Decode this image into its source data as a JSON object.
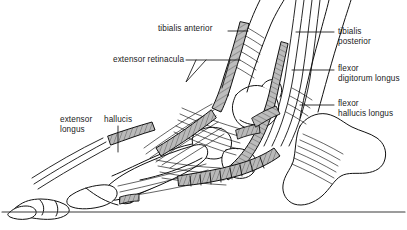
{
  "figure": {
    "ground_line": "ground-reference-line",
    "colors": {
      "outline": "#111111",
      "tendon_fill": "#a8a8a8",
      "tendon_fill_light": "#c9c9c9",
      "background": "#ffffff",
      "label_text": "#1a1a1a",
      "leader_line": "#111111"
    }
  },
  "labels": {
    "tibialis_anterior": {
      "text": "tibialis anterior"
    },
    "extensor_retinacula": {
      "text": "extensor retinacula"
    },
    "tibialis_posterior": {
      "line1": "tibialis",
      "line2": "posterior"
    },
    "flexor_digitorum_longus": {
      "line1": "flexor",
      "line2": "digitorum longus"
    },
    "flexor_hallucis_longus": {
      "line1": "flexor",
      "line2": "hallucis longus"
    },
    "extensor_hallucis_longus": {
      "word1": "extensor",
      "word2": "hallucis",
      "line2": "longus"
    }
  }
}
